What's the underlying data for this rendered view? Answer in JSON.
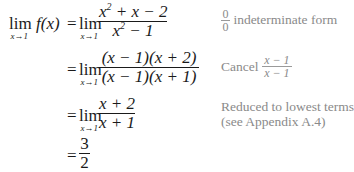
{
  "derivation": {
    "lhs": {
      "lim_word": "lim",
      "lim_sub": "x→1",
      "func": "f(x)"
    },
    "equals": "=",
    "steps": [
      {
        "lim_word": "lim",
        "lim_sub": "x→1",
        "numerator": "x² + x − 2",
        "denominator": "x² − 1",
        "note": {
          "frac_num": "0",
          "frac_den": "0",
          "text": "indeterminate form"
        }
      },
      {
        "lim_word": "lim",
        "lim_sub": "x→1",
        "numerator": "(x − 1)(x + 2)",
        "denominator": "(x − 1)(x + 1)",
        "note": {
          "prefix": "Cancel",
          "frac_num": "x − 1",
          "frac_den": "x − 1"
        }
      },
      {
        "lim_word": "lim",
        "lim_sub": "x→1",
        "numerator": "x + 2",
        "denominator": "x + 1",
        "note": {
          "line1": "Reduced to lowest terms",
          "line2": "(see Appendix A.4)"
        }
      },
      {
        "numerator": "3",
        "denominator": "2"
      }
    ]
  }
}
